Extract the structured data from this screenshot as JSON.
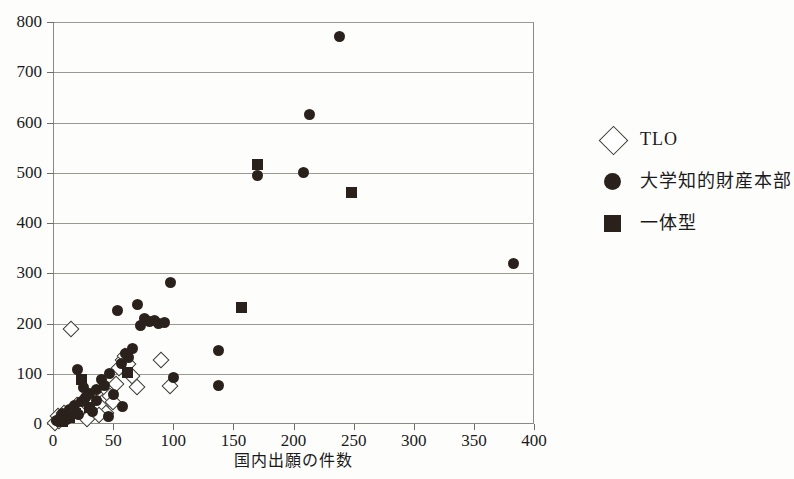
{
  "top_caption": "",
  "legend": {
    "position": "right",
    "items": [
      {
        "marker": "diamond-open-marker",
        "label": "TLO"
      },
      {
        "marker": "circle-filled-marker",
        "label": "大学知的財産本部"
      },
      {
        "marker": "square-filled-marker",
        "label": "一体型"
      }
    ]
  },
  "chart_data": {
    "type": "scatter",
    "title": "",
    "xlabel": "国内出願の件数",
    "ylabel": "",
    "xlim": [
      0,
      400
    ],
    "ylim": [
      0,
      800
    ],
    "xticks": [
      0,
      50,
      100,
      150,
      200,
      250,
      300,
      350,
      400
    ],
    "yticks": [
      0,
      100,
      200,
      300,
      400,
      500,
      600,
      700,
      800
    ],
    "grid": "horizontal",
    "legend_position": "right",
    "series": [
      {
        "name": "TLO",
        "marker": "diamond-open",
        "points": [
          [
            2,
            2
          ],
          [
            5,
            5
          ],
          [
            7,
            10
          ],
          [
            4,
            16
          ],
          [
            9,
            22
          ],
          [
            12,
            14
          ],
          [
            15,
            190
          ],
          [
            17,
            30
          ],
          [
            20,
            38
          ],
          [
            22,
            26
          ],
          [
            26,
            46
          ],
          [
            30,
            54
          ],
          [
            33,
            40
          ],
          [
            36,
            62
          ],
          [
            40,
            34
          ],
          [
            44,
            70
          ],
          [
            47,
            56
          ],
          [
            52,
            80
          ],
          [
            55,
            112
          ],
          [
            58,
            128
          ],
          [
            60,
            136
          ],
          [
            62,
            120
          ],
          [
            66,
            96
          ],
          [
            70,
            74
          ],
          [
            44,
            22
          ],
          [
            50,
            44
          ],
          [
            38,
            18
          ],
          [
            28,
            10
          ],
          [
            90,
            128
          ],
          [
            97,
            75
          ]
        ]
      },
      {
        "name": "大学知的財産本部",
        "marker": "circle-filled",
        "points": [
          [
            3,
            6
          ],
          [
            6,
            12
          ],
          [
            8,
            20
          ],
          [
            11,
            8
          ],
          [
            14,
            28
          ],
          [
            18,
            36
          ],
          [
            21,
            18
          ],
          [
            24,
            44
          ],
          [
            27,
            52
          ],
          [
            20,
            108
          ],
          [
            30,
            60
          ],
          [
            33,
            24
          ],
          [
            36,
            68
          ],
          [
            40,
            88
          ],
          [
            43,
            76
          ],
          [
            47,
            100
          ],
          [
            50,
            58
          ],
          [
            54,
            226
          ],
          [
            57,
            120
          ],
          [
            60,
            140
          ],
          [
            63,
            132
          ],
          [
            66,
            150
          ],
          [
            70,
            238
          ],
          [
            73,
            196
          ],
          [
            76,
            210
          ],
          [
            80,
            204
          ],
          [
            84,
            205
          ],
          [
            88,
            200
          ],
          [
            93,
            202
          ],
          [
            98,
            281
          ],
          [
            100,
            92
          ],
          [
            138,
            147
          ],
          [
            138,
            77
          ],
          [
            170,
            495
          ],
          [
            208,
            500
          ],
          [
            213,
            615
          ],
          [
            238,
            772
          ],
          [
            383,
            320
          ],
          [
            46,
            14
          ],
          [
            58,
            34
          ],
          [
            36,
            46
          ],
          [
            25,
            72
          ]
        ]
      },
      {
        "name": "一体型",
        "marker": "square-filled",
        "points": [
          [
            8,
            4
          ],
          [
            14,
            12
          ],
          [
            19,
            20
          ],
          [
            24,
            88
          ],
          [
            30,
            32
          ],
          [
            62,
            103
          ],
          [
            157,
            232
          ],
          [
            170,
            517
          ],
          [
            248,
            460
          ]
        ]
      }
    ]
  }
}
